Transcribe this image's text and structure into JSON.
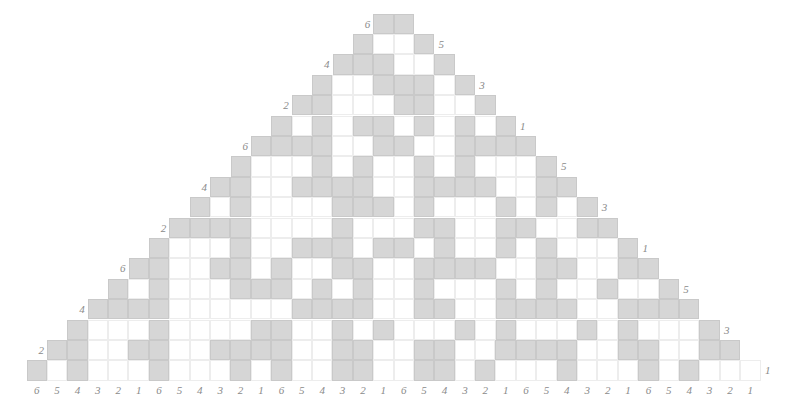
{
  "figure": {
    "type": "cellular-automaton-triangle",
    "rows_count": 18,
    "cell_size_px": 20.4,
    "top_row_cells": 2,
    "bottom_row_cells": 36,
    "colors": {
      "filled": "#d6d6d6",
      "empty": "#ffffff",
      "grid_line": "#e9e9e9",
      "label_text": "#8a8a8a",
      "background": "#ffffff"
    }
  },
  "axes": {
    "x_tick_labels": [
      "6",
      "5",
      "4",
      "3",
      "2",
      "1",
      "6",
      "5",
      "4",
      "3",
      "2",
      "1",
      "6",
      "5",
      "4",
      "3",
      "2",
      "1",
      "6",
      "5",
      "4",
      "3",
      "2",
      "1",
      "6",
      "5",
      "4",
      "3",
      "2",
      "1",
      "6",
      "5",
      "4",
      "3",
      "2",
      "1"
    ],
    "left_labels": [
      "6",
      "4",
      "2",
      "6",
      "4",
      "2",
      "6",
      "4",
      "2"
    ],
    "right_labels": [
      "5",
      "3",
      "1",
      "5",
      "3",
      "1",
      "5",
      "3",
      "1"
    ]
  },
  "chart_data": {
    "type": "heatmap",
    "title": "",
    "xlabel": "",
    "ylabel": "",
    "legend": [],
    "grid": true,
    "rows": [
      {
        "label_left": "6",
        "label_right": "",
        "offset": 17,
        "values": [
          1,
          1
        ]
      },
      {
        "label_left": "",
        "label_right": "5",
        "offset": 16,
        "values": [
          1,
          0,
          0,
          1
        ]
      },
      {
        "label_left": "4",
        "label_right": "",
        "offset": 15,
        "values": [
          1,
          1,
          1,
          0,
          0,
          1
        ]
      },
      {
        "label_left": "",
        "label_right": "3",
        "offset": 14,
        "values": [
          1,
          0,
          0,
          1,
          1,
          1,
          0,
          1
        ]
      },
      {
        "label_left": "2",
        "label_right": "",
        "offset": 13,
        "values": [
          1,
          1,
          0,
          0,
          0,
          1,
          1,
          0,
          0,
          1
        ]
      },
      {
        "label_left": "",
        "label_right": "1",
        "offset": 12,
        "values": [
          1,
          0,
          1,
          0,
          1,
          1,
          0,
          1,
          0,
          1,
          0,
          1
        ]
      },
      {
        "label_left": "6",
        "label_right": "",
        "offset": 11,
        "values": [
          1,
          1,
          1,
          1,
          0,
          0,
          1,
          1,
          0,
          0,
          1,
          1,
          1,
          1
        ]
      },
      {
        "label_left": "",
        "label_right": "5",
        "offset": 10,
        "values": [
          1,
          0,
          0,
          0,
          1,
          0,
          1,
          0,
          0,
          1,
          0,
          1,
          0,
          0,
          0,
          1
        ]
      },
      {
        "label_left": "4",
        "label_right": "",
        "offset": 9,
        "values": [
          1,
          1,
          0,
          0,
          1,
          1,
          1,
          1,
          0,
          0,
          1,
          1,
          1,
          1,
          0,
          0,
          1,
          1
        ]
      },
      {
        "label_left": "",
        "label_right": "3",
        "offset": 8,
        "values": [
          1,
          0,
          1,
          0,
          0,
          0,
          0,
          1,
          1,
          1,
          0,
          1,
          0,
          0,
          0,
          1,
          0,
          1,
          0,
          1
        ]
      },
      {
        "label_left": "2",
        "label_right": "",
        "offset": 7,
        "values": [
          1,
          1,
          1,
          1,
          0,
          0,
          0,
          0,
          1,
          0,
          0,
          0,
          1,
          1,
          0,
          0,
          1,
          1,
          0,
          0,
          1,
          1
        ]
      },
      {
        "label_left": "",
        "label_right": "1",
        "offset": 6,
        "values": [
          1,
          0,
          0,
          0,
          1,
          0,
          0,
          1,
          1,
          1,
          0,
          1,
          1,
          0,
          1,
          0,
          0,
          1,
          0,
          1,
          0,
          0,
          0,
          1
        ]
      },
      {
        "label_left": "6",
        "label_right": "",
        "offset": 5,
        "values": [
          1,
          1,
          0,
          0,
          1,
          1,
          0,
          1,
          0,
          0,
          1,
          1,
          0,
          0,
          1,
          1,
          1,
          1,
          0,
          0,
          1,
          1,
          0,
          0,
          1,
          1
        ]
      },
      {
        "label_left": "",
        "label_right": "5",
        "offset": 4,
        "values": [
          1,
          0,
          1,
          0,
          0,
          0,
          1,
          1,
          1,
          0,
          1,
          0,
          1,
          0,
          0,
          1,
          0,
          0,
          0,
          1,
          0,
          1,
          0,
          0,
          1,
          0,
          0,
          1
        ]
      },
      {
        "label_left": "4",
        "label_right": "",
        "offset": 3,
        "values": [
          1,
          1,
          1,
          1,
          0,
          0,
          0,
          0,
          0,
          0,
          1,
          1,
          1,
          1,
          0,
          0,
          1,
          1,
          0,
          0,
          1,
          1,
          1,
          1,
          0,
          0,
          1,
          1,
          1,
          1
        ]
      },
      {
        "label_left": "",
        "label_right": "3",
        "offset": 2,
        "values": [
          1,
          0,
          0,
          0,
          1,
          0,
          0,
          0,
          0,
          1,
          1,
          0,
          0,
          1,
          0,
          1,
          0,
          0,
          0,
          1,
          0,
          1,
          0,
          0,
          0,
          1,
          0,
          1,
          0,
          0,
          0,
          1
        ]
      },
      {
        "label_left": "2",
        "label_right": "",
        "offset": 1,
        "values": [
          1,
          1,
          0,
          0,
          1,
          1,
          0,
          0,
          1,
          1,
          1,
          1,
          0,
          0,
          1,
          1,
          0,
          0,
          1,
          1,
          0,
          0,
          1,
          1,
          1,
          1,
          0,
          0,
          1,
          1,
          0,
          0,
          1,
          1
        ]
      },
      {
        "label_left": "",
        "label_right": "1",
        "offset": 0,
        "values": [
          1,
          0,
          1,
          0,
          0,
          0,
          1,
          0,
          0,
          0,
          1,
          0,
          1,
          0,
          0,
          1,
          1,
          0,
          0,
          1,
          1,
          0,
          1,
          0,
          0,
          0,
          1,
          0,
          0,
          0,
          1,
          0,
          1,
          0,
          0,
          0
        ]
      }
    ]
  }
}
